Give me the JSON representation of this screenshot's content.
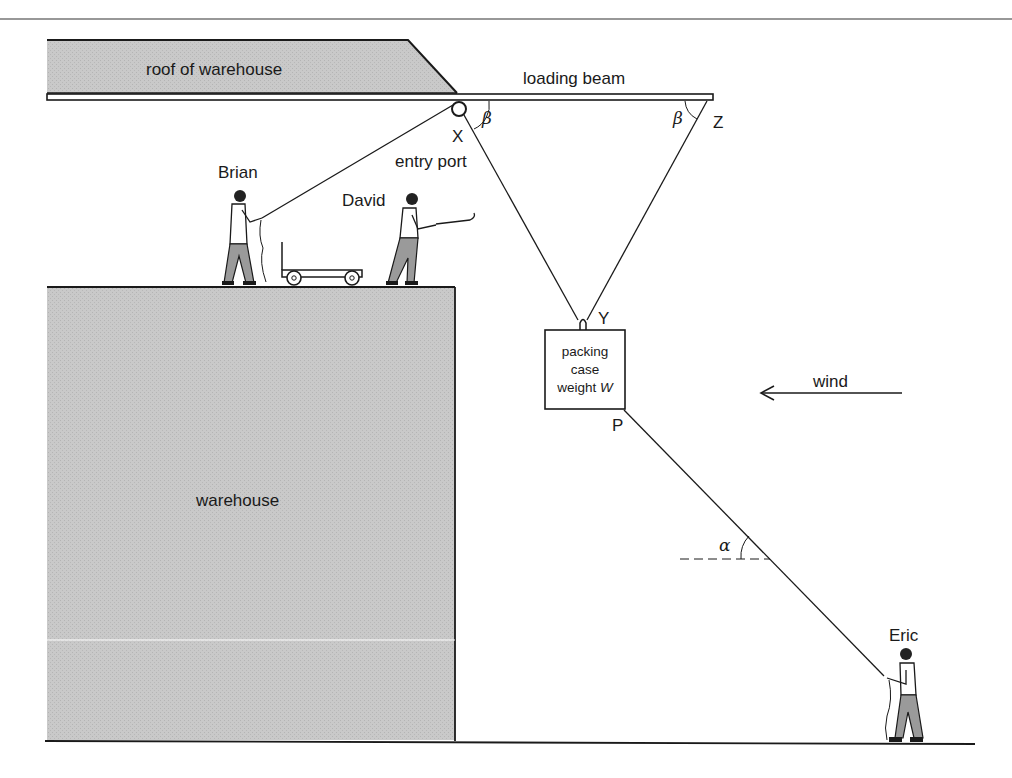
{
  "figure": {
    "type": "mechanics diagram",
    "labels": {
      "roof": "roof of warehouse",
      "beam": "loading beam",
      "entry_port": "entry port",
      "warehouse": "warehouse",
      "wind": "wind"
    },
    "people": {
      "brian": "Brian",
      "david": "David",
      "eric": "Eric"
    },
    "points": {
      "x": "X",
      "y": "Y",
      "z": "Z",
      "p": "P"
    },
    "angles": {
      "beta_x": "β",
      "beta_z": "β",
      "alpha": "α"
    },
    "packing_case": {
      "line1": "packing",
      "line2": "case",
      "line3_prefix": "weight ",
      "line3_var": "W"
    },
    "colors": {
      "ink": "#1a1a1a",
      "building_fill": "#c8c8c8",
      "background": "#ffffff"
    }
  }
}
